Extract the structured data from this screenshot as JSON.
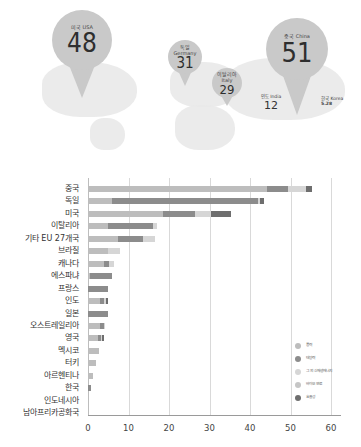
{
  "map": {
    "pins": [
      {
        "id": "usa",
        "label": "미국 USA",
        "value": "48"
      },
      {
        "id": "germany",
        "label_ko": "독일",
        "label_en": "Germany",
        "value": "31"
      },
      {
        "id": "italy",
        "label_ko": "이탈리아",
        "label_en": "Italy",
        "value": "29"
      },
      {
        "id": "china",
        "label": "중국 China",
        "value": "51"
      }
    ],
    "plain": [
      {
        "id": "india",
        "label": "인도 India",
        "value": "12"
      },
      {
        "id": "korea",
        "label": "한국 Korea",
        "value": "5.28"
      }
    ]
  },
  "colors": {
    "wind": "#bdbdbd",
    "solar": "#8c8c8c",
    "other_renewables": "#d6d6d6",
    "biofuel": "#c6c6c6",
    "efficiency": "#6e6e6e"
  },
  "legend": [
    {
      "key": "wind",
      "label": "풍력"
    },
    {
      "key": "solar",
      "label": "태양력"
    },
    {
      "key": "other_renewables",
      "label": "그 외 신재생에너지"
    },
    {
      "key": "biofuel",
      "label": "바이오 연료"
    },
    {
      "key": "efficiency",
      "label": "효율성"
    }
  ],
  "chart_data": {
    "type": "bar",
    "orientation": "horizontal",
    "stacked": true,
    "title": "",
    "xlabel": "",
    "ylabel": "",
    "xlim": [
      0,
      60
    ],
    "xticks": [
      0,
      10,
      20,
      30,
      40,
      50,
      60
    ],
    "grid": true,
    "legend_position": "right-bottom inside",
    "categories": [
      "중국",
      "독일",
      "미국",
      "이탈리아",
      "기타 EU 27개국",
      "브라질",
      "캐나다",
      "에스파냐",
      "프랑스",
      "인도",
      "일본",
      "오스트레일리아",
      "영국",
      "멕시코",
      "터키",
      "아르헨티나",
      "한국",
      "인도네시아",
      "남아프리카공화국"
    ],
    "series": [
      {
        "name": "풍력",
        "key": "wind",
        "values": [
          44.3,
          6,
          18.4,
          5,
          7.5,
          5,
          4,
          0.5,
          0,
          3,
          0,
          3,
          2.5,
          2.8,
          2,
          1.2,
          0,
          0.1,
          0
        ]
      },
      {
        "name": "태양력",
        "key": "solar",
        "values": [
          5,
          36,
          8,
          11,
          6,
          0,
          1.2,
          5.5,
          5,
          1,
          5,
          1,
          0.7,
          0,
          0,
          0,
          0.7,
          0,
          0
        ]
      },
      {
        "name": "그 외 신재생에너지",
        "key": "other_renewables",
        "values": [
          4.5,
          0.5,
          4,
          1,
          3,
          3,
          1.3,
          0,
          0,
          0.5,
          0,
          0.3,
          0.3,
          0,
          0,
          0,
          0,
          0,
          0
        ]
      },
      {
        "name": "바이오 연료",
        "key": "biofuel",
        "values": [
          0,
          0,
          0,
          0,
          0,
          0,
          0,
          0,
          0,
          0,
          0,
          0,
          0,
          0,
          0,
          0,
          0,
          0,
          0
        ]
      },
      {
        "name": "효율성",
        "key": "efficiency",
        "values": [
          1.5,
          1,
          5,
          0,
          0,
          0,
          0,
          0,
          0,
          0.5,
          0,
          0,
          0.5,
          0,
          0,
          0,
          0,
          0,
          0
        ]
      }
    ]
  }
}
